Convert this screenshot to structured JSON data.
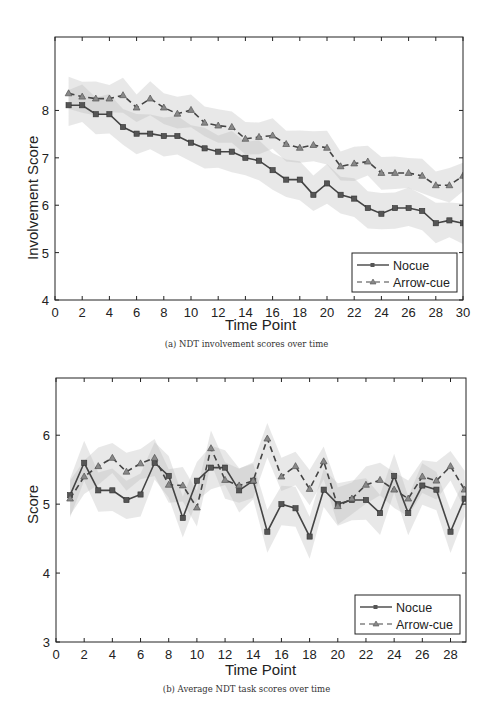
{
  "figures": [
    {
      "caption": "(a) NDT involvement scores over time",
      "xlabel": "Time Point",
      "ylabel": "Involvement Score"
    },
    {
      "caption": "(b) Average NDT task scores over time",
      "xlabel": "Time Point",
      "ylabel": "Score"
    }
  ],
  "legend": {
    "nocue": "Nocue",
    "arrowcue": "Arrow-cue"
  },
  "colors": {
    "line": "#444444",
    "band_outer": "#e6e6e6",
    "band_overlap": "#d6d6d6",
    "axis": "#222222"
  },
  "chart_data": [
    {
      "type": "line",
      "title": "(a) NDT involvement scores over time",
      "xlabel": "Time Point",
      "ylabel": "Involvement Score",
      "xlim": [
        0,
        30
      ],
      "ylim": [
        4,
        9.55
      ],
      "xticks": [
        0,
        2,
        4,
        6,
        8,
        10,
        12,
        14,
        16,
        18,
        20,
        22,
        24,
        26,
        28,
        30
      ],
      "yticks": [
        4,
        5,
        6,
        7,
        8
      ],
      "grid": false,
      "legend_position": "lower right",
      "x": [
        1,
        2,
        3,
        4,
        5,
        6,
        7,
        8,
        9,
        10,
        11,
        12,
        13,
        14,
        15,
        16,
        17,
        18,
        19,
        20,
        21,
        22,
        23,
        24,
        25,
        26,
        27,
        28,
        29,
        30
      ],
      "series": [
        {
          "name": "Nocue",
          "style": "solid, square markers",
          "values": [
            8.11,
            8.11,
            7.92,
            7.92,
            7.65,
            7.51,
            7.51,
            7.46,
            7.46,
            7.32,
            7.2,
            7.13,
            7.13,
            7.0,
            6.94,
            6.74,
            6.54,
            6.54,
            6.22,
            6.46,
            6.22,
            6.14,
            5.94,
            5.82,
            5.94,
            5.94,
            5.88,
            5.62,
            5.68,
            5.62
          ],
          "band_halfwidth": 0.38
        },
        {
          "name": "Arrow-cue",
          "style": "dashed, triangle markers",
          "values": [
            8.36,
            8.29,
            8.25,
            8.25,
            8.32,
            8.06,
            8.25,
            8.06,
            7.93,
            8.01,
            7.74,
            7.68,
            7.65,
            7.4,
            7.44,
            7.47,
            7.29,
            7.21,
            7.27,
            7.21,
            6.82,
            6.88,
            6.92,
            6.68,
            6.68,
            6.68,
            6.62,
            6.42,
            6.42,
            6.62
          ],
          "band_halfwidth": 0.32
        }
      ]
    },
    {
      "type": "line",
      "title": "(b) Average NDT task scores over time",
      "xlabel": "Time Point",
      "ylabel": "Score",
      "xlim": [
        0,
        29.1
      ],
      "ylim": [
        3,
        6.83
      ],
      "xticks": [
        0,
        2,
        4,
        6,
        8,
        10,
        12,
        14,
        16,
        18,
        20,
        22,
        24,
        26,
        28
      ],
      "yticks": [
        3,
        4,
        5,
        6
      ],
      "grid": false,
      "legend_position": "lower right",
      "x": [
        1,
        2,
        3,
        4,
        5,
        6,
        7,
        8,
        9,
        10,
        11,
        12,
        13,
        14,
        15,
        16,
        17,
        18,
        19,
        20,
        21,
        22,
        23,
        24,
        25,
        26,
        27,
        28,
        29
      ],
      "series": [
        {
          "name": "Nocue",
          "style": "solid, square markers",
          "values": [
            5.13,
            5.6,
            5.2,
            5.2,
            5.06,
            5.14,
            5.6,
            5.41,
            4.8,
            5.34,
            5.53,
            5.53,
            5.2,
            5.34,
            4.6,
            5.0,
            4.94,
            4.53,
            5.21,
            5.0,
            5.06,
            5.06,
            4.87,
            5.41,
            4.87,
            5.27,
            5.21,
            4.6,
            5.08
          ],
          "band_halfwidth": 0.28
        },
        {
          "name": "Arrow-cue",
          "style": "dashed, triangle markers",
          "values": [
            5.08,
            5.4,
            5.55,
            5.67,
            5.47,
            5.59,
            5.67,
            5.28,
            5.27,
            4.95,
            5.81,
            5.35,
            5.27,
            5.34,
            5.95,
            5.4,
            5.55,
            5.22,
            5.62,
            4.97,
            5.08,
            5.28,
            5.35,
            5.21,
            5.08,
            5.4,
            5.34,
            5.55,
            5.21
          ],
          "band_halfwidth": 0.24
        }
      ]
    }
  ]
}
